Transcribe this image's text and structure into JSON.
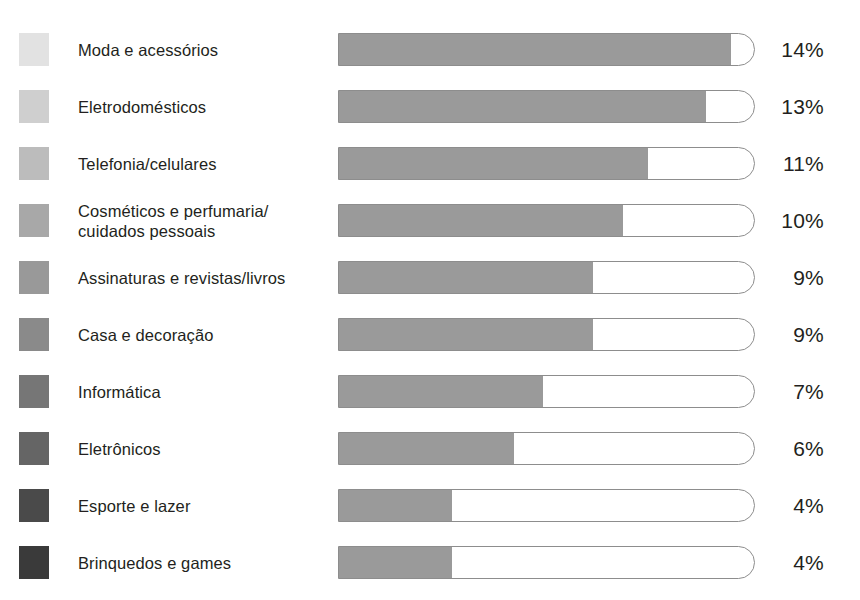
{
  "chart_data": {
    "type": "bar",
    "title": "",
    "subtitle": "",
    "xlabel": "",
    "ylabel": "",
    "orientation": "horizontal",
    "value_suffix": "%",
    "grid": false,
    "legend_position": "left",
    "axis_range_note": "bar track length represents 100%; fills are not drawn to a zero-origin linear scale",
    "categories": [
      "Moda e acessórios",
      "Eletrodomésticos",
      "Telefonia/celulares",
      "Cosméticos e perfumaria/\ncuidados pessoais",
      "Assinaturas e revistas/livros",
      "Casa e decoração",
      "Informática",
      "Eletrônicos",
      "Esporte e lazer",
      "Brinquedos e games"
    ],
    "values": [
      14,
      13,
      11,
      10,
      9,
      9,
      7,
      6,
      4,
      4
    ],
    "value_labels": [
      "14%",
      "13%",
      "11%",
      "10%",
      "9%",
      "9%",
      "7%",
      "6%",
      "4%",
      "4%"
    ],
    "bar_fill_fraction": [
      0.94,
      0.88,
      0.74,
      0.68,
      0.61,
      0.61,
      0.49,
      0.42,
      0.27,
      0.27
    ],
    "bar_fill_color": "#9a9a9a",
    "bar_track_border_color": "#8d8d8d",
    "bar_track_fill_color": "#ffffff",
    "legend_swatch_colors": [
      "#e2e2e2",
      "#cfcfcf",
      "#bcbcbc",
      "#a8a8a8",
      "#999999",
      "#8a8a8a",
      "#767676",
      "#656565",
      "#4a4a4a",
      "#3a3a3a"
    ],
    "background_color": "#ffffff",
    "text_color": "#231f20"
  }
}
